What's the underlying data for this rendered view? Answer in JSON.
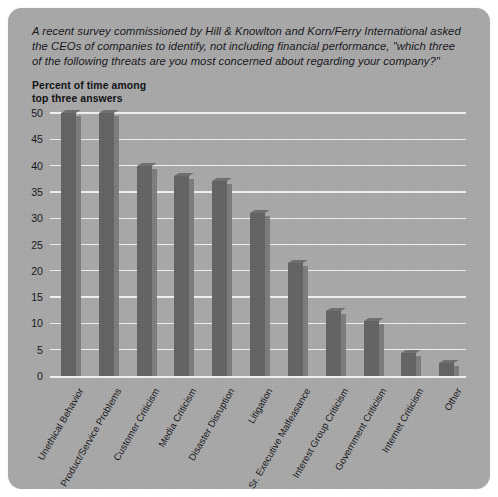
{
  "caption": "A recent survey commissioned by Hill & Knowlton and Korn/Ferry International asked the CEOs of companies to identify, not including financial performance, \"which three of the following threats are you most concerned about regarding your company?\"",
  "axis_label": "Percent of time among\ntop three answers",
  "colors": {
    "card_background": "#a9a9a9",
    "bar_face": "#636363",
    "bar_side": "#7d7d7d",
    "gridline": "#f2f2f2",
    "text": "#16161a"
  },
  "chart_data": {
    "type": "bar",
    "title": "",
    "subtitle": "",
    "xlabel": "",
    "ylabel": "Percent of time among top three answers",
    "ylim": [
      0,
      50
    ],
    "yticks": [
      0,
      5,
      10,
      15,
      20,
      25,
      30,
      35,
      40,
      45,
      50
    ],
    "grid": true,
    "legend": "none",
    "categories": [
      "Unethical Behavior",
      "Product/Service Problems",
      "Customer Criticism",
      "Media Criticism",
      "Disaster Disruption",
      "Litigation",
      "Sr. Executive Malfeasance",
      "Interest Group Criticism",
      "Government  Criticism",
      "Internet Criticism",
      "Other"
    ],
    "values": [
      50,
      50,
      40,
      38,
      37,
      31,
      21.5,
      12.3,
      10.4,
      4.3,
      2.5
    ]
  }
}
